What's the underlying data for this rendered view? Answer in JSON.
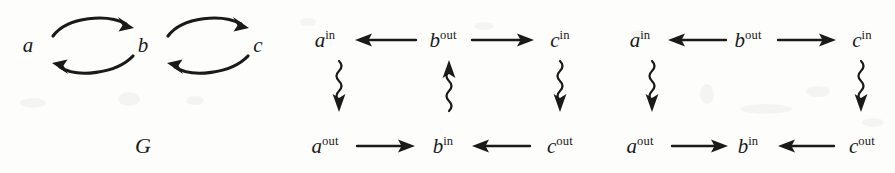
{
  "figure": {
    "caption_label": "G",
    "background_color": "#fdfdfb",
    "ink_color": "#1a1a1a"
  },
  "diagrams": [
    {
      "name": "graph-G",
      "type": "directed-graph",
      "caption": "G",
      "nodes": [
        {
          "id": "a",
          "label": "a",
          "superscript": "",
          "x": 28,
          "y": 45
        },
        {
          "id": "b",
          "label": "b",
          "superscript": "",
          "x": 143,
          "y": 45
        },
        {
          "id": "c",
          "label": "c",
          "superscript": "",
          "x": 258,
          "y": 45
        }
      ],
      "edges": [
        {
          "from": "a",
          "to": "b",
          "style": "curved-solid",
          "direction": "right",
          "arc": "top"
        },
        {
          "from": "b",
          "to": "a",
          "style": "curved-solid",
          "direction": "left",
          "arc": "bottom"
        },
        {
          "from": "b",
          "to": "c",
          "style": "curved-solid",
          "direction": "right",
          "arc": "top"
        },
        {
          "from": "c",
          "to": "b",
          "style": "curved-solid",
          "direction": "left",
          "arc": "bottom"
        }
      ]
    },
    {
      "name": "bipartite-diagram-1",
      "type": "bipartite-diagram",
      "nodes": [
        {
          "id": "a_in",
          "label": "a",
          "superscript": "in",
          "x": 325,
          "y": 40
        },
        {
          "id": "b_out",
          "label": "b",
          "superscript": "out",
          "x": 443,
          "y": 40
        },
        {
          "id": "c_in",
          "label": "c",
          "superscript": "in",
          "x": 560,
          "y": 40
        },
        {
          "id": "a_out",
          "label": "a",
          "superscript": "out",
          "x": 325,
          "y": 146
        },
        {
          "id": "b_in",
          "label": "b",
          "superscript": "in",
          "x": 443,
          "y": 146
        },
        {
          "id": "c_out",
          "label": "c",
          "superscript": "out",
          "x": 560,
          "y": 146
        }
      ],
      "edges": [
        {
          "from": "b_out",
          "to": "a_in",
          "style": "straight-solid",
          "direction": "left"
        },
        {
          "from": "b_out",
          "to": "c_in",
          "style": "straight-solid",
          "direction": "right"
        },
        {
          "from": "a_out",
          "to": "b_in",
          "style": "straight-solid",
          "direction": "right"
        },
        {
          "from": "c_out",
          "to": "b_in",
          "style": "straight-solid",
          "direction": "left"
        },
        {
          "from": "a_in",
          "to": "a_out",
          "style": "squiggly",
          "direction": "down"
        },
        {
          "from": "b_in",
          "to": "b_out",
          "style": "squiggly",
          "direction": "up"
        },
        {
          "from": "c_in",
          "to": "c_out",
          "style": "squiggly",
          "direction": "down"
        }
      ]
    },
    {
      "name": "bipartite-diagram-2",
      "type": "bipartite-diagram",
      "nodes": [
        {
          "id": "a_in",
          "label": "a",
          "superscript": "in",
          "x": 640,
          "y": 40
        },
        {
          "id": "b_out",
          "label": "b",
          "superscript": "out",
          "x": 748,
          "y": 40
        },
        {
          "id": "c_in",
          "label": "c",
          "superscript": "in",
          "x": 862,
          "y": 40
        },
        {
          "id": "a_out",
          "label": "a",
          "superscript": "out",
          "x": 640,
          "y": 146
        },
        {
          "id": "b_in",
          "label": "b",
          "superscript": "in",
          "x": 748,
          "y": 146
        },
        {
          "id": "c_out",
          "label": "c",
          "superscript": "out",
          "x": 862,
          "y": 146
        }
      ],
      "edges": [
        {
          "from": "b_out",
          "to": "a_in",
          "style": "straight-solid",
          "direction": "left"
        },
        {
          "from": "b_out",
          "to": "c_in",
          "style": "straight-solid",
          "direction": "right"
        },
        {
          "from": "a_out",
          "to": "b_in",
          "style": "straight-solid",
          "direction": "right"
        },
        {
          "from": "c_out",
          "to": "b_in",
          "style": "straight-solid",
          "direction": "left"
        },
        {
          "from": "a_in",
          "to": "a_out",
          "style": "squiggly",
          "direction": "down"
        },
        {
          "from": "c_in",
          "to": "c_out",
          "style": "squiggly",
          "direction": "down"
        }
      ]
    }
  ]
}
